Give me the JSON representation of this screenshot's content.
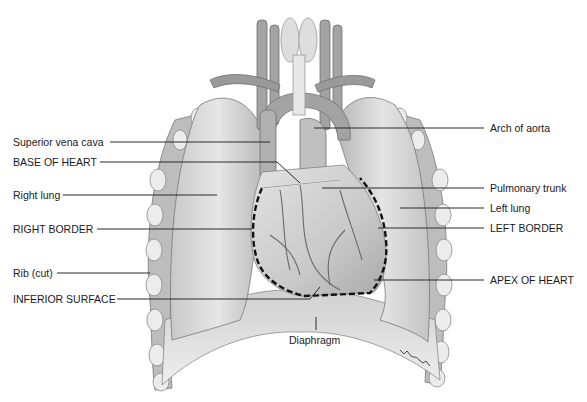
{
  "figure": {
    "labels_left": [
      {
        "key": "svc",
        "text": "Superior vena cava"
      },
      {
        "key": "base",
        "text": "BASE OF HEART"
      },
      {
        "key": "rlung",
        "text": "Right lung"
      },
      {
        "key": "rborder",
        "text": "RIGHT BORDER"
      },
      {
        "key": "rib",
        "text": "Rib (cut)"
      },
      {
        "key": "inferior",
        "text": "INFERIOR SURFACE"
      }
    ],
    "labels_right": [
      {
        "key": "aorta",
        "text": "Arch of aorta"
      },
      {
        "key": "ptrunk",
        "text": "Pulmonary trunk"
      },
      {
        "key": "llung",
        "text": "Left lung"
      },
      {
        "key": "lborder",
        "text": "LEFT BORDER"
      },
      {
        "key": "apex",
        "text": "APEX OF HEART"
      }
    ],
    "label_bottom": {
      "key": "diaphragm",
      "text": "Diaphragm"
    },
    "colors": {
      "ink": "#1a1a1a",
      "tissue_light": "#e4e4e4",
      "tissue_mid": "#bdbdbd",
      "tissue_dark": "#8a8a8a",
      "vessel": "#9a9a9a",
      "dashed_outline": "#111111"
    }
  }
}
